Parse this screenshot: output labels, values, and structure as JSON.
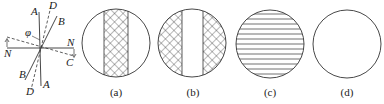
{
  "figure": {
    "axis_diagram": {
      "labels": {
        "A_top": "A",
        "A_bottom": "A",
        "D_top": "D",
        "D_bottom": "D",
        "B_top": "B",
        "B_bottom": "B",
        "N_left": "N",
        "N_right": "N",
        "C": "C",
        "phi": "φ"
      }
    },
    "panels": [
      {
        "caption": "(a)",
        "pattern": "crosshatch-center-band"
      },
      {
        "caption": "(b)",
        "pattern": "crosshatch-sides"
      },
      {
        "caption": "(c)",
        "pattern": "horizontal-lines"
      },
      {
        "caption": "(d)",
        "pattern": "blank"
      }
    ],
    "colors": {
      "stroke": "#333333",
      "background": "#ffffff"
    }
  }
}
